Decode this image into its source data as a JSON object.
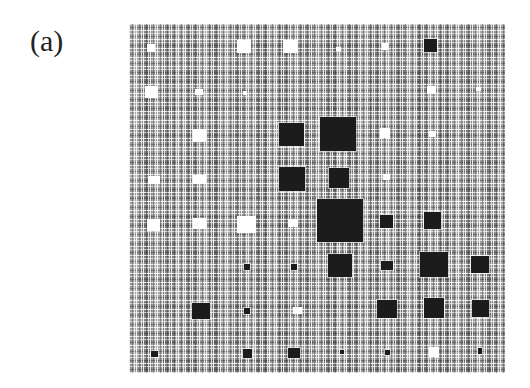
{
  "figure": {
    "panel_label": "(a)",
    "pattern": {
      "description": "Grayscale crosshatch texture panel with embedded dark and white squares of varying sizes",
      "left": 129,
      "top": 24,
      "width": 376,
      "height": 349,
      "colors": {
        "texture_base": "#8a8a8a",
        "dark_square": "#1c1c1c",
        "light_square": "#ffffff"
      }
    },
    "dark_squares": [
      {
        "x": 279,
        "y": 123,
        "w": 25,
        "h": 23
      },
      {
        "x": 320,
        "y": 117,
        "w": 36,
        "h": 34
      },
      {
        "x": 279,
        "y": 167,
        "w": 26,
        "h": 24
      },
      {
        "x": 329,
        "y": 168,
        "w": 20,
        "h": 20
      },
      {
        "x": 317,
        "y": 199,
        "w": 46,
        "h": 43
      },
      {
        "x": 424,
        "y": 39,
        "w": 13,
        "h": 13
      },
      {
        "x": 380,
        "y": 215,
        "w": 13,
        "h": 13
      },
      {
        "x": 424,
        "y": 212,
        "w": 17,
        "h": 17
      },
      {
        "x": 328,
        "y": 254,
        "w": 24,
        "h": 23
      },
      {
        "x": 381,
        "y": 261,
        "w": 12,
        "h": 9
      },
      {
        "x": 420,
        "y": 252,
        "w": 28,
        "h": 25
      },
      {
        "x": 471,
        "y": 256,
        "w": 18,
        "h": 17
      },
      {
        "x": 192,
        "y": 303,
        "w": 18,
        "h": 16
      },
      {
        "x": 377,
        "y": 300,
        "w": 20,
        "h": 18
      },
      {
        "x": 424,
        "y": 298,
        "w": 20,
        "h": 20
      },
      {
        "x": 472,
        "y": 300,
        "w": 17,
        "h": 17
      },
      {
        "x": 244,
        "y": 264,
        "w": 6,
        "h": 6
      },
      {
        "x": 291,
        "y": 264,
        "w": 6,
        "h": 6
      },
      {
        "x": 244,
        "y": 308,
        "w": 6,
        "h": 6
      },
      {
        "x": 151,
        "y": 351,
        "w": 7,
        "h": 6
      },
      {
        "x": 243,
        "y": 349,
        "w": 9,
        "h": 9
      },
      {
        "x": 288,
        "y": 348,
        "w": 12,
        "h": 10
      },
      {
        "x": 340,
        "y": 350,
        "w": 4,
        "h": 4
      },
      {
        "x": 385,
        "y": 350,
        "w": 5,
        "h": 5
      },
      {
        "x": 478,
        "y": 348,
        "w": 4,
        "h": 6
      }
    ],
    "light_squares": [
      {
        "x": 147,
        "y": 44,
        "w": 8,
        "h": 8
      },
      {
        "x": 237,
        "y": 40,
        "w": 14,
        "h": 13
      },
      {
        "x": 283,
        "y": 40,
        "w": 14,
        "h": 13
      },
      {
        "x": 382,
        "y": 43,
        "w": 6,
        "h": 7
      },
      {
        "x": 336,
        "y": 47,
        "w": 5,
        "h": 4
      },
      {
        "x": 145,
        "y": 86,
        "w": 13,
        "h": 12
      },
      {
        "x": 195,
        "y": 89,
        "w": 8,
        "h": 6
      },
      {
        "x": 243,
        "y": 91,
        "w": 4,
        "h": 4
      },
      {
        "x": 427,
        "y": 86,
        "w": 9,
        "h": 8
      },
      {
        "x": 476,
        "y": 87,
        "w": 5,
        "h": 4
      },
      {
        "x": 193,
        "y": 129,
        "w": 13,
        "h": 13
      },
      {
        "x": 380,
        "y": 128,
        "w": 10,
        "h": 10
      },
      {
        "x": 429,
        "y": 131,
        "w": 7,
        "h": 6
      },
      {
        "x": 148,
        "y": 176,
        "w": 12,
        "h": 8
      },
      {
        "x": 193,
        "y": 175,
        "w": 13,
        "h": 9
      },
      {
        "x": 383,
        "y": 174,
        "w": 7,
        "h": 6
      },
      {
        "x": 147,
        "y": 219,
        "w": 13,
        "h": 12
      },
      {
        "x": 193,
        "y": 218,
        "w": 13,
        "h": 11
      },
      {
        "x": 237,
        "y": 216,
        "w": 19,
        "h": 17
      },
      {
        "x": 288,
        "y": 219,
        "w": 10,
        "h": 8
      },
      {
        "x": 293,
        "y": 307,
        "w": 9,
        "h": 7
      },
      {
        "x": 429,
        "y": 347,
        "w": 10,
        "h": 10
      }
    ]
  }
}
